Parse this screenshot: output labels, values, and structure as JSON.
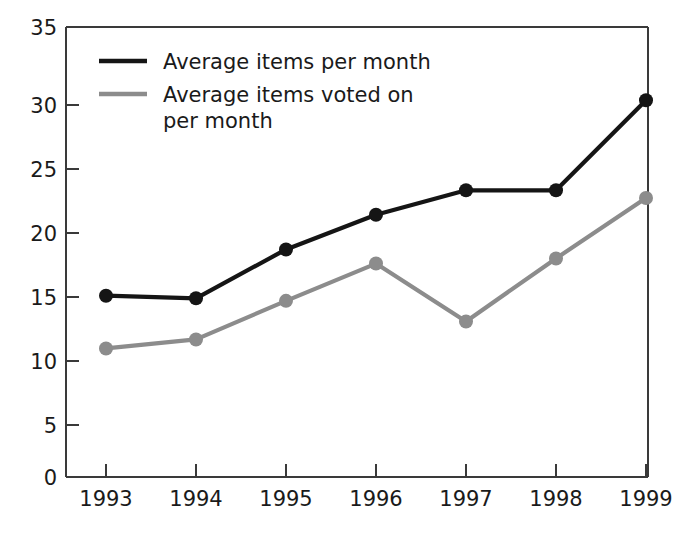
{
  "chart_data": {
    "type": "line",
    "title": "",
    "xlabel": "",
    "ylabel": "",
    "categories": [
      "1993",
      "1994",
      "1995",
      "1996",
      "1997",
      "1998",
      "1999"
    ],
    "x": [
      1993,
      1994,
      1995,
      1996,
      1997,
      1998,
      1999
    ],
    "series": [
      {
        "name": "Average items per month",
        "color": "#151515",
        "values": [
          14.1,
          13.9,
          17.7,
          20.4,
          22.3,
          22.3,
          29.3
        ]
      },
      {
        "name": "Average items voted on per month",
        "color": "#8c8c8c",
        "values": [
          10.0,
          10.7,
          13.7,
          16.6,
          12.1,
          17.0,
          21.7
        ]
      }
    ],
    "ylim": [
      0,
      35
    ],
    "yticks": [
      0,
      5,
      10,
      15,
      20,
      25,
      30,
      35
    ],
    "ytick_labels": [
      "0",
      "5",
      "10",
      "15",
      "20",
      "25",
      "30",
      "35"
    ],
    "xtick_labels": [
      "1993",
      "1994",
      "1995",
      "1996",
      "1997",
      "1998",
      "1999"
    ],
    "grid": false,
    "legend_position": "top-left-inside",
    "legend": [
      {
        "label_line1": "Average items per month",
        "label_line2": ""
      },
      {
        "label_line1": "Average items voted on",
        "label_line2": "per month"
      }
    ]
  },
  "colors": {
    "primary_series": "#151515",
    "secondary_series": "#8c8c8c",
    "axis": "#3a3a3a",
    "text": "#1a1a1a",
    "background": "#ffffff"
  }
}
